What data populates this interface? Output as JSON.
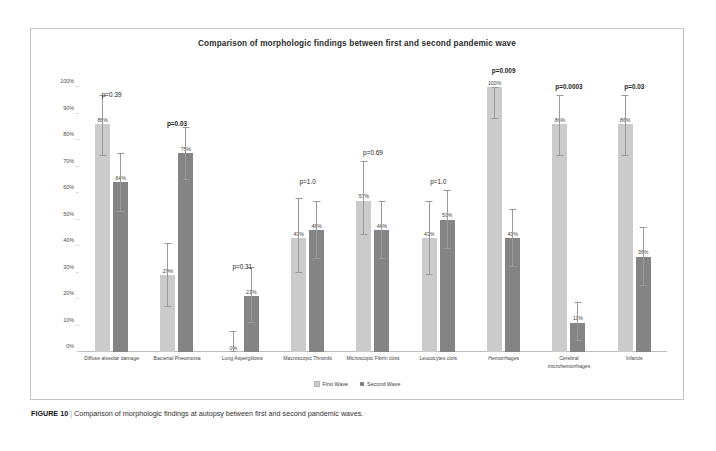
{
  "figure": {
    "caption_number": "FIGURE 10",
    "caption_separator": "|",
    "caption_text": "Comparison of morphologic findings at autopsy between first and second pandemic waves."
  },
  "legend": {
    "position": "bottom-center",
    "items": [
      {
        "label": "First Wave",
        "color": "#cbcbcb"
      },
      {
        "label": "Second Wave",
        "color": "#848484"
      }
    ]
  },
  "chart_data": {
    "type": "bar",
    "title": "Comparison of morphologic findings between first and second pandemic wave",
    "xlabel": "",
    "ylabel": "",
    "ylim": [
      0,
      100
    ],
    "grid": false,
    "ytick_labels": [
      "0%",
      "10%",
      "20%",
      "30%",
      "40%",
      "50%",
      "60%",
      "70%",
      "80%",
      "90%",
      "100%"
    ],
    "ytick_values": [
      0,
      10,
      20,
      30,
      40,
      50,
      60,
      70,
      80,
      90,
      100
    ],
    "categories": [
      "Diffuse alveolar damage",
      "Bacterial Pneumonia",
      "Lung Aspergillosis",
      "Macroscopic Thrombi",
      "Microscopic Fibrin clots",
      "Leucocytes clots",
      "Hemorrhages",
      "Cerebral microhemorrhages",
      "Infarcts"
    ],
    "series": [
      {
        "name": "First Wave",
        "color": "#cbcbcb",
        "values": [
          86,
          29,
          0,
          43,
          57,
          43,
          100,
          86,
          86
        ],
        "labels": [
          "86%",
          "29%",
          "0%",
          "43%",
          "57%",
          "43%",
          "100%",
          "86%",
          "86%"
        ],
        "err_low": [
          74,
          17,
          0,
          30,
          44,
          29,
          88,
          74,
          74
        ],
        "err_high": [
          97,
          41,
          8,
          58,
          72,
          57,
          100,
          97,
          97
        ]
      },
      {
        "name": "Second Wave",
        "color": "#848484",
        "values": [
          64,
          75,
          21,
          46,
          46,
          50,
          43,
          11,
          36
        ],
        "labels": [
          "64%",
          "75%",
          "21%",
          "46%",
          "46%",
          "50%",
          "43%",
          "11%",
          "36%"
        ],
        "err_low": [
          53,
          65,
          11,
          35,
          35,
          39,
          32,
          4,
          25
        ],
        "err_high": [
          75,
          85,
          32,
          57,
          57,
          61,
          54,
          19,
          47
        ]
      }
    ],
    "annotations": [
      {
        "category": "Diffuse alveolar damage",
        "text": "p=0.39",
        "bold": false,
        "y": 96
      },
      {
        "category": "Bacterial Pneumonia",
        "text": "p=0.03",
        "bold": true,
        "y": 85
      },
      {
        "category": "Lung Aspergillosis",
        "text": "p=0.31",
        "bold": false,
        "y": 31
      },
      {
        "category": "Macroscopic Thrombi",
        "text": "p=1.0",
        "bold": false,
        "y": 63
      },
      {
        "category": "Microscopic Fibrin clots",
        "text": "p=0.69",
        "bold": false,
        "y": 74
      },
      {
        "category": "Leucocytes clots",
        "text": "p=1.0",
        "bold": false,
        "y": 63
      },
      {
        "category": "Hemorrhages",
        "text": "p=0.009",
        "bold": true,
        "y": 105
      },
      {
        "category": "Cerebral microhemorrhages",
        "text": "p=0.0003",
        "bold": true,
        "y": 99
      },
      {
        "category": "Infarcts",
        "text": "p=0.03",
        "bold": true,
        "y": 99
      }
    ]
  }
}
